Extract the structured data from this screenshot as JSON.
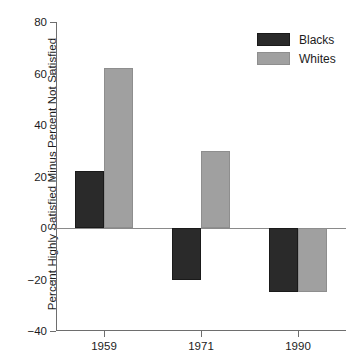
{
  "chart_data": {
    "type": "bar",
    "title": "",
    "subtitle": "",
    "xlabel": "",
    "ylabel": "Percent Highly Satisfied Minus Percent Not Satisfied",
    "categories": [
      "1959",
      "1971",
      "1990"
    ],
    "series": [
      {
        "name": "Blacks",
        "color": "#2a2a2a",
        "values": [
          22,
          -20,
          -25
        ]
      },
      {
        "name": "Whites",
        "color": "#a0a0a0",
        "values": [
          62,
          30,
          -25
        ]
      }
    ],
    "ylim": [
      -40,
      80
    ],
    "yticks": [
      80,
      60,
      40,
      20,
      0,
      -20,
      -40
    ],
    "ytick_labels": [
      "80",
      "60",
      "40",
      "20",
      "0",
      "−20",
      "−40"
    ],
    "grid": false,
    "zero_line": true,
    "legend": {
      "position": "top-right",
      "entries": [
        {
          "label": "Blacks",
          "color": "#2a2a2a"
        },
        {
          "label": "Whites",
          "color": "#a0a0a0"
        }
      ]
    },
    "axis_color": "#6e6e6e",
    "background": "#ffffff"
  }
}
